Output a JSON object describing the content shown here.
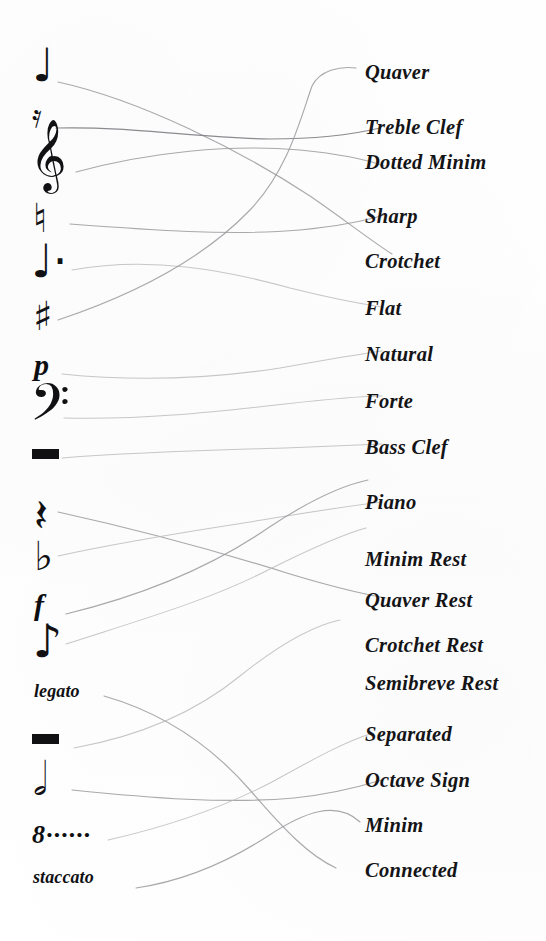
{
  "worksheet": {
    "type": "matching-exercise",
    "title": "Music Symbol Matching",
    "background_color": "#fefefe",
    "line_color": "#9a9a9e",
    "ink_color": "#111114"
  },
  "symbols": [
    {
      "id": "crotchet",
      "glyph": "♩",
      "kind": "note",
      "name": "crotchet-note-symbol",
      "y": 55,
      "size": "med"
    },
    {
      "id": "quaver-rest",
      "glyph": "𝄿",
      "kind": "rest",
      "name": "quaver-rest-symbol",
      "y": 108,
      "size": "small"
    },
    {
      "id": "treble-clef",
      "glyph": "𝄞",
      "kind": "clef",
      "name": "treble-clef-symbol",
      "y": 128,
      "size": "big"
    },
    {
      "id": "natural",
      "glyph": "♮",
      "kind": "accidental",
      "name": "natural-sign-symbol",
      "y": 203,
      "size": "med"
    },
    {
      "id": "dotted-minim",
      "glyph": "♩·",
      "kind": "note",
      "name": "dotted-minim-symbol",
      "y": 242,
      "size": "med"
    },
    {
      "id": "sharp",
      "glyph": "♯",
      "kind": "accidental",
      "name": "sharp-sign-symbol",
      "y": 300,
      "size": "med"
    },
    {
      "id": "piano-dynamic",
      "glyph": "p",
      "kind": "dynamic",
      "name": "piano-dynamic-symbol",
      "y": 348,
      "size": "dyn"
    },
    {
      "id": "bass-clef",
      "glyph": "𝄢",
      "kind": "clef",
      "name": "bass-clef-symbol",
      "y": 382,
      "size": "big"
    },
    {
      "id": "minim-rest",
      "glyph": "bar",
      "kind": "rest",
      "name": "minim-rest-symbol",
      "y": 446,
      "size": "bar"
    },
    {
      "id": "crotchet-rest",
      "glyph": "𝄽",
      "kind": "rest",
      "name": "crotchet-rest-symbol",
      "y": 498,
      "size": "med"
    },
    {
      "id": "flat",
      "glyph": "♭",
      "kind": "accidental",
      "name": "flat-sign-symbol",
      "y": 540,
      "size": "med"
    },
    {
      "id": "forte-dynamic",
      "glyph": "f",
      "kind": "dynamic",
      "name": "forte-dynamic-symbol",
      "y": 588,
      "size": "dyn"
    },
    {
      "id": "quaver",
      "glyph": "♪",
      "kind": "note",
      "name": "quaver-note-symbol",
      "y": 622,
      "size": "med"
    },
    {
      "id": "legato",
      "glyph": "legato",
      "kind": "word",
      "name": "legato-term",
      "y": 686,
      "size": "word"
    },
    {
      "id": "semibreve-rest",
      "glyph": "bar",
      "kind": "rest",
      "name": "semibreve-rest-symbol",
      "y": 735,
      "size": "bar"
    },
    {
      "id": "minim",
      "glyph": "𝅗𝅥",
      "kind": "note",
      "name": "minim-note-symbol",
      "y": 760,
      "size": "med"
    },
    {
      "id": "octave-sign",
      "glyph": "8······",
      "kind": "sign",
      "name": "octave-sign-symbol",
      "y": 822,
      "size": "octave"
    },
    {
      "id": "staccato",
      "glyph": "staccato",
      "kind": "word",
      "name": "staccato-term",
      "y": 870,
      "size": "word"
    }
  ],
  "labels": [
    {
      "id": "quaver",
      "text": "Quaver",
      "y": 62,
      "name": "label-quaver"
    },
    {
      "id": "treble-clef",
      "text": "Treble  Clef",
      "y": 117,
      "name": "label-treble-clef"
    },
    {
      "id": "dotted-minim",
      "text": "Dotted Minim",
      "y": 152,
      "name": "label-dotted-minim"
    },
    {
      "id": "sharp",
      "text": "Sharp",
      "y": 206,
      "name": "label-sharp"
    },
    {
      "id": "crotchet",
      "text": "Crotchet",
      "y": 251,
      "name": "label-crotchet"
    },
    {
      "id": "flat",
      "text": "Flat",
      "y": 298,
      "name": "label-flat"
    },
    {
      "id": "natural",
      "text": "Natural",
      "y": 344,
      "name": "label-natural"
    },
    {
      "id": "forte",
      "text": "Forte",
      "y": 391,
      "name": "label-forte"
    },
    {
      "id": "bass-clef",
      "text": "Bass  Clef",
      "y": 437,
      "name": "label-bass-clef"
    },
    {
      "id": "piano",
      "text": "Piano",
      "y": 492,
      "name": "label-piano"
    },
    {
      "id": "minim-rest",
      "text": "Minim Rest",
      "y": 549,
      "name": "label-minim-rest"
    },
    {
      "id": "quaver-rest",
      "text": "Quaver Rest",
      "y": 590,
      "name": "label-quaver-rest"
    },
    {
      "id": "crotchet-rest",
      "text": "Crotchet Rest",
      "y": 635,
      "name": "label-crotchet-rest"
    },
    {
      "id": "semibreve-rest",
      "text": "Semibreve Rest",
      "y": 673,
      "name": "label-semibreve-rest"
    },
    {
      "id": "separated",
      "text": "Separated",
      "y": 724,
      "name": "label-separated"
    },
    {
      "id": "octave-sign",
      "text": "Octave  Sign",
      "y": 770,
      "name": "label-octave-sign"
    },
    {
      "id": "minim",
      "text": "Minim",
      "y": 815,
      "name": "label-minim"
    },
    {
      "id": "connected",
      "text": "Connected",
      "y": 860,
      "name": "label-connected"
    }
  ],
  "connections": [
    {
      "from": "crotchet",
      "to": "crotchet",
      "name": "connector-crotchet"
    },
    {
      "from": "quaver-rest",
      "to": "treble-clef",
      "name": "connector-quaver-rest"
    },
    {
      "from": "treble-clef",
      "to": "dotted-minim",
      "name": "connector-treble-clef"
    },
    {
      "from": "natural",
      "to": "sharp",
      "name": "connector-natural"
    },
    {
      "from": "dotted-minim",
      "to": "flat",
      "name": "connector-dotted-minim"
    },
    {
      "from": "sharp",
      "to": "quaver",
      "name": "connector-sharp"
    },
    {
      "from": "piano-dynamic",
      "to": "natural",
      "name": "connector-piano"
    },
    {
      "from": "bass-clef",
      "to": "forte",
      "name": "connector-bass-clef"
    },
    {
      "from": "minim-rest",
      "to": "bass-clef",
      "name": "connector-minim-rest"
    },
    {
      "from": "crotchet-rest",
      "to": "quaver-rest",
      "name": "connector-crotchet-rest"
    },
    {
      "from": "flat",
      "to": "minim-rest",
      "name": "connector-flat"
    },
    {
      "from": "forte-dynamic",
      "to": "piano",
      "name": "connector-forte"
    },
    {
      "from": "quaver",
      "to": "crotchet-rest",
      "name": "connector-quaver"
    },
    {
      "from": "legato",
      "to": "connected",
      "name": "connector-legato"
    },
    {
      "from": "semibreve-rest",
      "to": "semibreve-rest",
      "name": "connector-semibreve-rest"
    },
    {
      "from": "minim",
      "to": "octave-sign",
      "name": "connector-minim"
    },
    {
      "from": "octave-sign",
      "to": "separated",
      "name": "connector-octave-sign"
    },
    {
      "from": "staccato",
      "to": "minim",
      "name": "connector-staccato"
    }
  ]
}
